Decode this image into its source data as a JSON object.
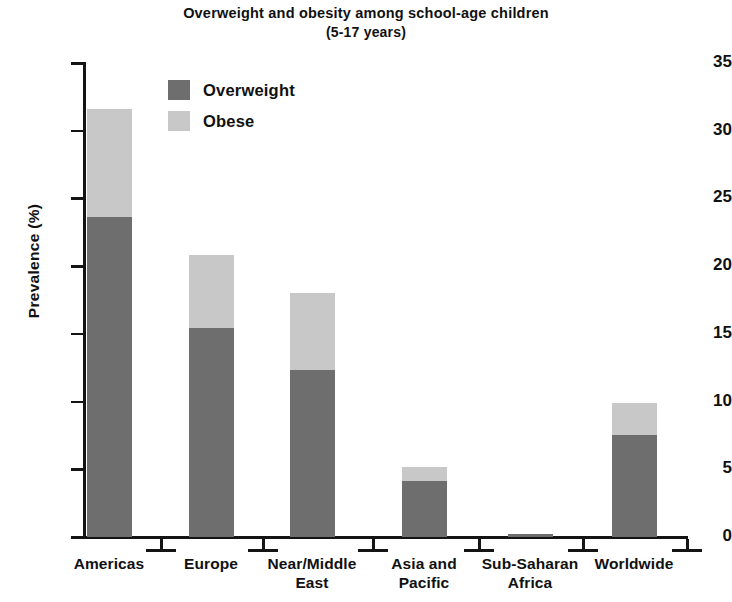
{
  "chart_data": {
    "type": "bar",
    "subtype": "stacked-bar",
    "title": "Overweight and obesity among school-age children",
    "subtitle": "(5-17 years)",
    "xlabel": "",
    "ylabel": "Prevalence (%)",
    "ylim": [
      0,
      35
    ],
    "yticks": [
      0,
      5,
      10,
      15,
      20,
      25,
      30,
      35
    ],
    "ytick_labels": [
      "0",
      "5",
      "10",
      "15",
      "20",
      "25",
      "30",
      "35"
    ],
    "grid": false,
    "legend_position": "inside-upper-left",
    "categories": [
      "Americas",
      "Europe",
      "Near/Middle East",
      "Asia and Pacific",
      "Sub-Saharan Africa",
      "Worldwide"
    ],
    "category_lines": [
      [
        "Americas"
      ],
      [
        "Europe"
      ],
      [
        "Near/Middle",
        "East"
      ],
      [
        "Asia and",
        "Pacific"
      ],
      [
        "Sub-Saharan",
        "Africa"
      ],
      [
        "Worldwide"
      ]
    ],
    "series": [
      {
        "name": "Overweight",
        "color": "#6e6e6e",
        "values": [
          23.6,
          15.4,
          12.3,
          4.1,
          0.2,
          7.5
        ]
      },
      {
        "name": "Obese",
        "color": "#c8c8c8",
        "values": [
          8.0,
          5.4,
          5.7,
          1.1,
          0.05,
          2.4
        ]
      }
    ],
    "totals": [
      31.6,
      20.8,
      18.0,
      5.2,
      0.25,
      9.9
    ]
  },
  "legend": {
    "items": [
      {
        "label": "Overweight",
        "color": "#6e6e6e"
      },
      {
        "label": "Obese",
        "color": "#c8c8c8"
      }
    ]
  },
  "colors": {
    "overweight": "#6e6e6e",
    "obese": "#c8c8c8",
    "axis": "#141414",
    "text": "#111111",
    "background": "#ffffff"
  }
}
